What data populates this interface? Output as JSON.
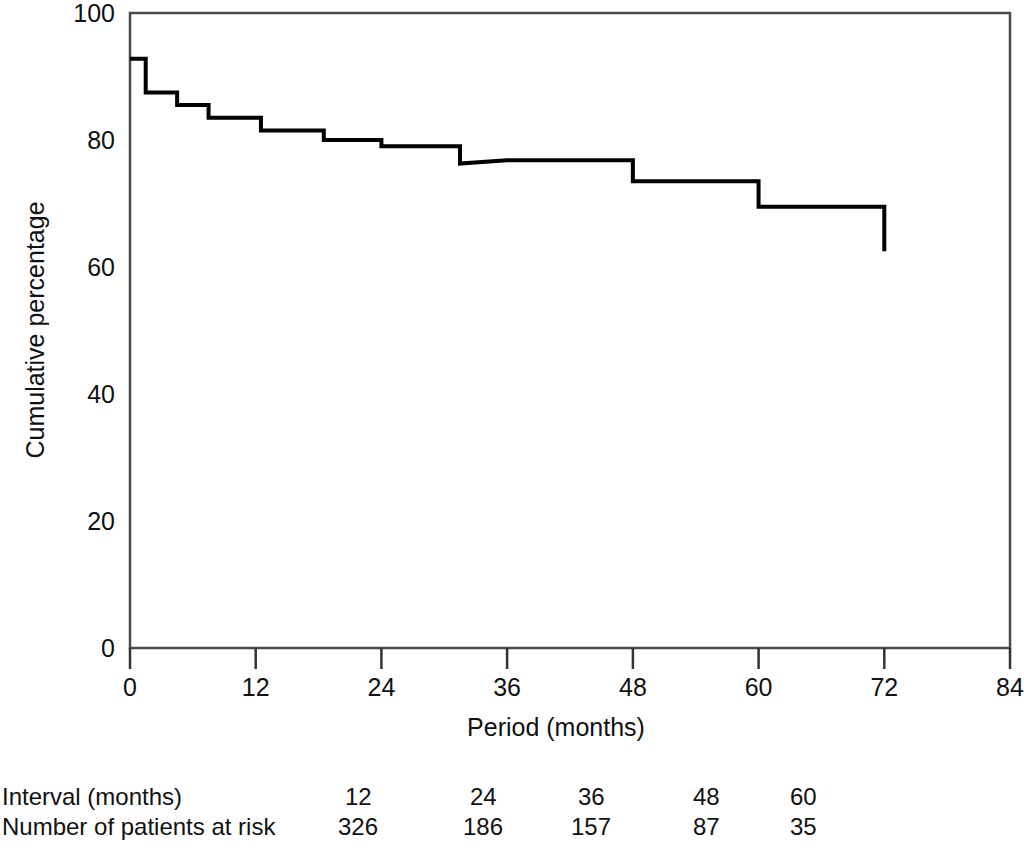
{
  "chart_data": {
    "type": "line",
    "subtype": "kaplan-meier-step",
    "title": "",
    "xlabel": "Period (months)",
    "ylabel": "Cumulative percentage",
    "xlim": [
      0,
      84
    ],
    "ylim": [
      0,
      100
    ],
    "xticks": [
      0,
      12,
      24,
      36,
      48,
      60,
      72,
      84
    ],
    "xtick_labels": [
      "0",
      "12",
      "24",
      "36",
      "48",
      "60",
      "72",
      "84"
    ],
    "yticks": [
      0,
      20,
      40,
      60,
      80,
      100
    ],
    "ytick_labels": [
      "0",
      "20",
      "40",
      "60",
      "80",
      "100"
    ],
    "grid": false,
    "legend": false,
    "line_color": "#000000",
    "line_width": 4,
    "series": [
      {
        "name": "Cumulative survival",
        "step": "post",
        "x": [
          0,
          1.5,
          1.5,
          4.5,
          4.5,
          7.5,
          7.5,
          12.5,
          12.5,
          18.5,
          18.5,
          24.0,
          24.0,
          31.5,
          31.5,
          36.0,
          36.0,
          48.0,
          48.0,
          60.0,
          60.0,
          72.0
        ],
        "y": [
          92.8,
          92.8,
          87.5,
          87.5,
          85.5,
          85.5,
          83.5,
          83.5,
          81.5,
          81.5,
          80.0,
          80.0,
          79.0,
          79.0,
          76.3,
          76.8,
          76.8,
          76.8,
          73.5,
          73.5,
          69.5,
          69.5
        ],
        "values_at_ticks": {
          "0": 92.8,
          "12": 83.5,
          "24": 76.3,
          "36": 73.5,
          "48": 69.5,
          "60": 62.5,
          "72": 62.5
        },
        "final_value": 62.5,
        "drops": [
          {
            "x": 1.5,
            "from": 92.8,
            "to": 87.5
          },
          {
            "x": 4.5,
            "from": 87.5,
            "to": 85.5
          },
          {
            "x": 7.5,
            "from": 85.5,
            "to": 83.5
          },
          {
            "x": 12.5,
            "from": 83.5,
            "to": 81.5
          },
          {
            "x": 18.5,
            "from": 81.5,
            "to": 80.0
          },
          {
            "x": 24.0,
            "from": 80.0,
            "to": 76.3
          },
          {
            "x": 36.0,
            "from": 76.8,
            "to": 73.5
          },
          {
            "x": 48.0,
            "from": 73.5,
            "to": 69.5
          },
          {
            "x": 60.0,
            "from": 69.5,
            "to": 62.5
          }
        ]
      }
    ]
  },
  "risk_table": {
    "rows": [
      {
        "label": "Interval (months)",
        "values": [
          "12",
          "24",
          "36",
          "48",
          "60"
        ]
      },
      {
        "label": "Number of patients at risk",
        "values": [
          "326",
          "186",
          "157",
          "87",
          "35"
        ]
      }
    ]
  }
}
